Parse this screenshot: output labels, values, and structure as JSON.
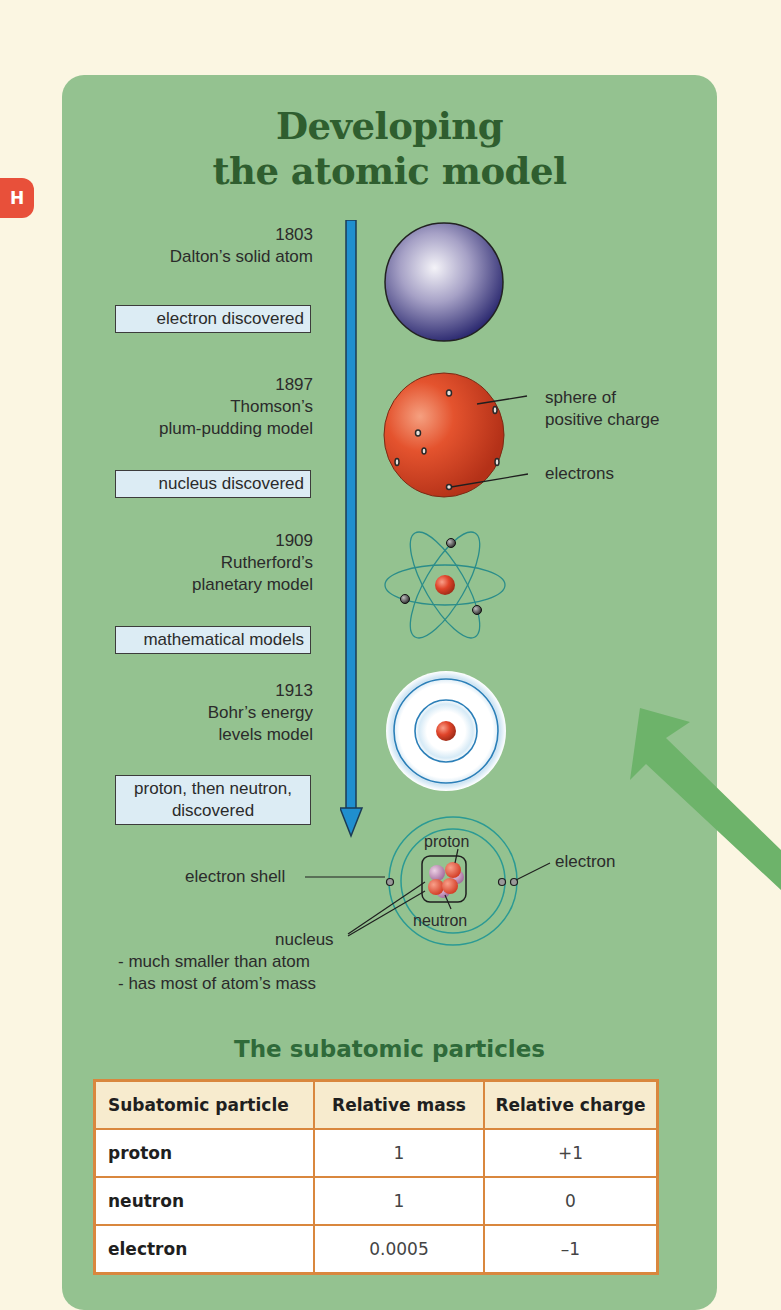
{
  "badge": {
    "label": "H",
    "color": "#e8503a"
  },
  "title": {
    "line1": "Developing",
    "line2": "the atomic model",
    "color": "#2f5e2f"
  },
  "panel_color": "#94c290",
  "timeline": {
    "arrow_color": "#1f8fcf",
    "models": [
      {
        "year": "1803",
        "name_line1": "Dalton’s solid atom",
        "name_line2": "",
        "name_line3": ""
      },
      {
        "year": "1897",
        "name_line1": "Thomson’s",
        "name_line2": "plum-pudding model",
        "name_line3": ""
      },
      {
        "year": "1909",
        "name_line1": "Rutherford’s",
        "name_line2": "planetary model",
        "name_line3": ""
      },
      {
        "year": "1913",
        "name_line1": "Bohr’s energy",
        "name_line2": "levels model",
        "name_line3": ""
      }
    ],
    "events": [
      {
        "line1": "electron discovered",
        "line2": ""
      },
      {
        "line1": "nucleus discovered",
        "line2": ""
      },
      {
        "line1": "mathematical models",
        "line2": ""
      },
      {
        "line1": "proton, then neutron,",
        "line2": "discovered"
      }
    ]
  },
  "annotations": {
    "thomson_sphere_line1": "sphere of",
    "thomson_sphere_line2": "positive charge",
    "thomson_electrons": "electrons",
    "modern_proton": "proton",
    "modern_neutron": "neutron",
    "modern_electron": "electron",
    "modern_shell": "electron shell",
    "nucleus": "nucleus",
    "nucleus_note1": "- much smaller than atom",
    "nucleus_note2": "- has most of atom’s mass"
  },
  "table": {
    "title": "The subatomic particles",
    "headers": [
      "Subatomic particle",
      "Relative mass",
      "Relative charge"
    ],
    "rows": [
      {
        "particle": "proton",
        "mass": "1",
        "charge": "+1"
      },
      {
        "particle": "neutron",
        "mass": "1",
        "charge": "0"
      },
      {
        "particle": "electron",
        "mass": "0.0005",
        "charge": "–1"
      }
    ],
    "border_color": "#d9873e",
    "header_bg": "#f7ebce"
  }
}
